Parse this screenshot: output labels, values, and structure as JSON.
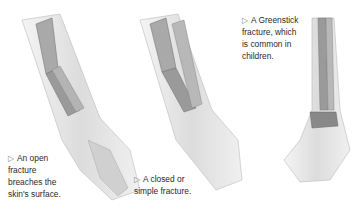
{
  "figures": [
    {
      "id": "open",
      "caption_lines": [
        "An open",
        "fracture",
        "breaches the",
        "skin's surface."
      ],
      "marker": "▷"
    },
    {
      "id": "closed",
      "caption_lines": [
        "A closed or",
        "simple fracture."
      ],
      "marker": "▷"
    },
    {
      "id": "greenstick",
      "caption_lines": [
        "A Greenstick",
        "fracture, which",
        "is common in",
        "children."
      ],
      "marker": "▷"
    }
  ]
}
